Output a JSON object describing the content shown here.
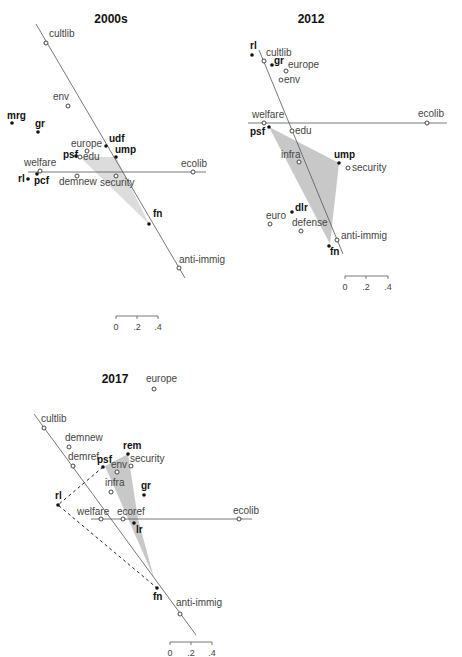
{
  "chart_data": [
    {
      "type": "scatter",
      "title": "2000s",
      "description": "Biplot of parties (filled dots) and issue dimensions (open circles) with two axis lines and shaded convex region",
      "issues": [
        {
          "label": "cultlib",
          "x": 46,
          "y": 43
        },
        {
          "label": "env",
          "x": 68,
          "y": 106
        },
        {
          "label": "europe",
          "x": 87,
          "y": 151
        },
        {
          "label": "edu",
          "x": 80,
          "y": 157
        },
        {
          "label": "welfare",
          "x": 40,
          "y": 171
        },
        {
          "label": "demnew",
          "x": 77,
          "y": 176
        },
        {
          "label": "security",
          "x": 116,
          "y": 176
        },
        {
          "label": "ecolib",
          "x": 193,
          "y": 172
        },
        {
          "label": "anti-immig",
          "x": 179,
          "y": 268
        }
      ],
      "parties": [
        {
          "label": "mrg",
          "x": 12,
          "y": 123
        },
        {
          "label": "gr",
          "x": 38,
          "y": 132
        },
        {
          "label": "udf",
          "x": 106,
          "y": 146
        },
        {
          "label": "ump",
          "x": 116,
          "y": 157
        },
        {
          "label": "psf",
          "x": 76,
          "y": 156
        },
        {
          "label": "pcf",
          "x": 37,
          "y": 174
        },
        {
          "label": "rl",
          "x": 28,
          "y": 179
        },
        {
          "label": "fn",
          "x": 149,
          "y": 224
        }
      ],
      "scale": {
        "ticks": [
          "0",
          ".2",
          ".4"
        ]
      }
    },
    {
      "type": "scatter",
      "title": "2012",
      "issues": [
        {
          "label": "cultlib",
          "x": 264,
          "y": 61
        },
        {
          "label": "europe",
          "x": 286,
          "y": 71
        },
        {
          "label": "env",
          "x": 281,
          "y": 80
        },
        {
          "label": "welfare",
          "x": 264,
          "y": 123
        },
        {
          "label": "ecolib",
          "x": 427,
          "y": 123
        },
        {
          "label": "edu",
          "x": 292,
          "y": 131
        },
        {
          "label": "infra",
          "x": 299,
          "y": 162
        },
        {
          "label": "security",
          "x": 348,
          "y": 168
        },
        {
          "label": "euro",
          "x": 270,
          "y": 224
        },
        {
          "label": "defense",
          "x": 301,
          "y": 231
        },
        {
          "label": "anti-immig",
          "x": 337,
          "y": 240
        }
      ],
      "parties": [
        {
          "label": "rl",
          "x": 252,
          "y": 55
        },
        {
          "label": "gr",
          "x": 272,
          "y": 65
        },
        {
          "label": "psf",
          "x": 269,
          "y": 127
        },
        {
          "label": "ump",
          "x": 339,
          "y": 163
        },
        {
          "label": "dlr",
          "x": 292,
          "y": 212
        },
        {
          "label": "fn",
          "x": 329,
          "y": 246
        }
      ],
      "scale": {
        "ticks": [
          "0",
          ".2",
          ".4"
        ]
      }
    },
    {
      "type": "scatter",
      "title": "2017",
      "issues": [
        {
          "label": "europe",
          "x": 154,
          "y": 389
        },
        {
          "label": "cultlib",
          "x": 44,
          "y": 428
        },
        {
          "label": "demnew",
          "x": 69,
          "y": 447
        },
        {
          "label": "demref",
          "x": 73,
          "y": 466
        },
        {
          "label": "env",
          "x": 117,
          "y": 472
        },
        {
          "label": "security",
          "x": 131,
          "y": 466
        },
        {
          "label": "infra",
          "x": 111,
          "y": 492
        },
        {
          "label": "welfare",
          "x": 101,
          "y": 519
        },
        {
          "label": "ecoref",
          "x": 123,
          "y": 519
        },
        {
          "label": "ecolib",
          "x": 239,
          "y": 519
        },
        {
          "label": "anti-immig",
          "x": 180,
          "y": 614
        }
      ],
      "parties": [
        {
          "label": "rem",
          "x": 128,
          "y": 454
        },
        {
          "label": "psf",
          "x": 103,
          "y": 467
        },
        {
          "label": "gr",
          "x": 144,
          "y": 495
        },
        {
          "label": "rl",
          "x": 58,
          "y": 505
        },
        {
          "label": "lr",
          "x": 134,
          "y": 523
        },
        {
          "label": "fn",
          "x": 157,
          "y": 588
        }
      ],
      "scale": {
        "ticks": [
          "0",
          ".2",
          ".4"
        ]
      }
    }
  ],
  "panels": [
    {
      "title": "2000s"
    },
    {
      "title": "2012"
    },
    {
      "title": "2017"
    }
  ],
  "scale_ticks": [
    "0",
    ".2",
    ".4"
  ]
}
